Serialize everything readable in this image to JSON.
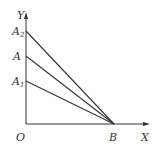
{
  "diagram": {
    "axes": {
      "y_label": "Y",
      "x_label": "X",
      "origin_label": "O"
    },
    "points": [
      {
        "id": "A2",
        "base": "A",
        "sub": "2",
        "y": 31
      },
      {
        "id": "A",
        "base": "A",
        "sub": "",
        "y": 56
      },
      {
        "id": "A1",
        "base": "A",
        "sub": "1",
        "y": 81
      }
    ],
    "b_label": "B",
    "lines": [
      {
        "from": "A2",
        "to": "B"
      },
      {
        "from": "A",
        "to": "B"
      },
      {
        "from": "A1",
        "to": "B"
      }
    ],
    "colors": {
      "line": "#333333",
      "background": "#ffffff"
    }
  }
}
